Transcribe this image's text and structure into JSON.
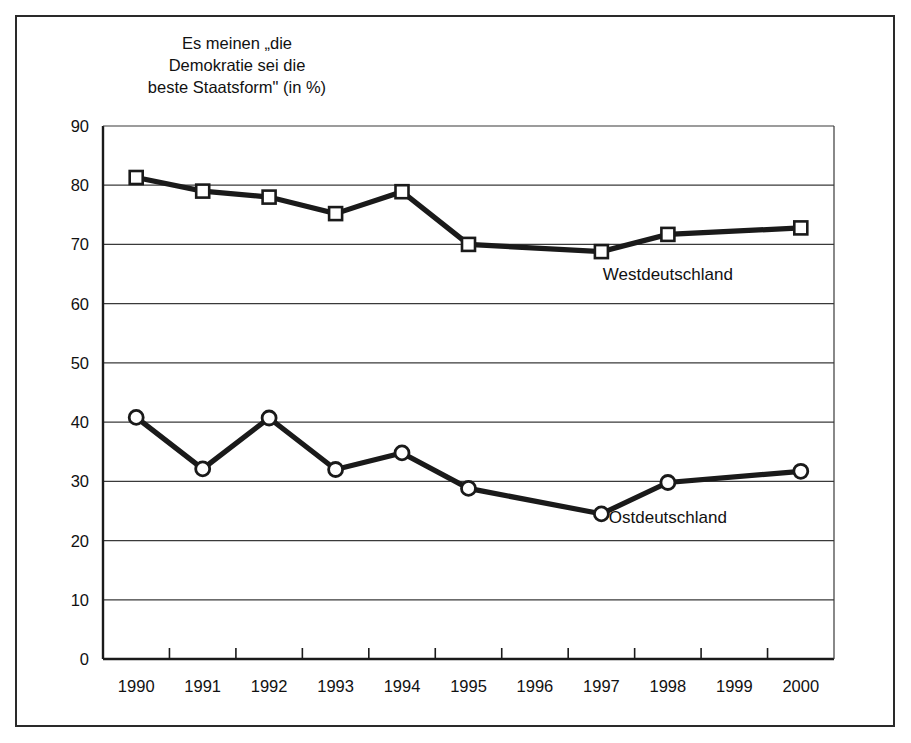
{
  "chart_data": {
    "type": "line",
    "title": "Es meinen „die\nDemokratie sei die\nbeste Staatsform\" (in %)",
    "xlabel": "",
    "ylabel": "",
    "categories": [
      "1990",
      "1991",
      "1992",
      "1993",
      "1994",
      "1995",
      "1996",
      "1997",
      "1998",
      "1999",
      "2000"
    ],
    "ylim": [
      0,
      90
    ],
    "yticks": [
      0,
      10,
      20,
      30,
      40,
      50,
      60,
      70,
      80,
      90
    ],
    "ytick_labels": [
      "0",
      "10",
      "20",
      "30",
      "40",
      "50",
      "60",
      "70",
      "80",
      "90"
    ],
    "grid": true,
    "legend_position": "inline-annotation",
    "series": [
      {
        "name": "Westdeutschland",
        "marker": "open-square",
        "values": [
          81.3,
          79.0,
          78.0,
          75.2,
          78.9,
          70.0,
          null,
          68.8,
          71.7,
          null,
          72.8
        ]
      },
      {
        "name": "Ostdeutschland",
        "marker": "open-circle",
        "values": [
          40.8,
          32.1,
          40.7,
          32.0,
          34.8,
          28.8,
          null,
          24.5,
          29.8,
          null,
          31.7
        ]
      }
    ],
    "annotations": [
      {
        "text": "Westdeutschland",
        "near_x": "1998",
        "near_y": 64
      },
      {
        "text": "Ostdeutschland",
        "near_x": "1998",
        "near_y": 23
      }
    ]
  },
  "axis": {
    "y_tick_labels": [
      "90",
      "80",
      "70",
      "60",
      "50",
      "40",
      "30",
      "20",
      "10",
      "0"
    ],
    "x_tick_labels": [
      "1990",
      "1991",
      "1992",
      "1993",
      "1994",
      "1995",
      "1996",
      "1997",
      "1998",
      "1999",
      "2000"
    ]
  },
  "series_labels": {
    "west": "Westdeutschland",
    "east": "Ostdeutschland"
  }
}
